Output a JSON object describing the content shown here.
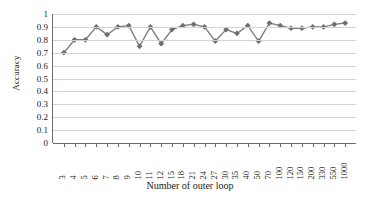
{
  "chart_data": {
    "type": "line",
    "title": "",
    "xlabel": "Number of outer loop",
    "ylabel": "Accuracy",
    "ylim": [
      0,
      1
    ],
    "ytick_labels": [
      "0",
      "0.1",
      "0.2",
      "0.3",
      "0.4",
      "0.5",
      "0.6",
      "0.7",
      "0.8",
      "0.9",
      "1"
    ],
    "ytick_values": [
      0,
      0.1,
      0.2,
      0.3,
      0.4,
      0.5,
      0.6,
      0.7,
      0.8,
      0.9,
      1
    ],
    "grid": true,
    "legend": "none",
    "marker": "diamond",
    "line_color": "#808080",
    "marker_color": "#6e6e6e",
    "categories": [
      "3",
      "4",
      "5",
      "6",
      "7",
      "8",
      "9",
      "10",
      "11",
      "12",
      "15",
      "18",
      "21",
      "24",
      "27",
      "30",
      "35",
      "40",
      "50",
      "70",
      "100",
      "120",
      "150",
      "200",
      "330",
      "550",
      "1000"
    ],
    "values": [
      0.7,
      0.8,
      0.8,
      0.9,
      0.84,
      0.9,
      0.91,
      0.75,
      0.9,
      0.77,
      0.88,
      0.91,
      0.92,
      0.9,
      0.79,
      0.88,
      0.85,
      0.91,
      0.79,
      0.93,
      0.91,
      0.89,
      0.89,
      0.9,
      0.9,
      0.92,
      0.93
    ],
    "series": [
      {
        "name": "Accuracy",
        "values": [
          0.7,
          0.8,
          0.8,
          0.9,
          0.84,
          0.9,
          0.91,
          0.75,
          0.9,
          0.77,
          0.88,
          0.91,
          0.92,
          0.9,
          0.79,
          0.88,
          0.85,
          0.91,
          0.79,
          0.93,
          0.91,
          0.89,
          0.89,
          0.9,
          0.9,
          0.92,
          0.93
        ]
      }
    ]
  }
}
